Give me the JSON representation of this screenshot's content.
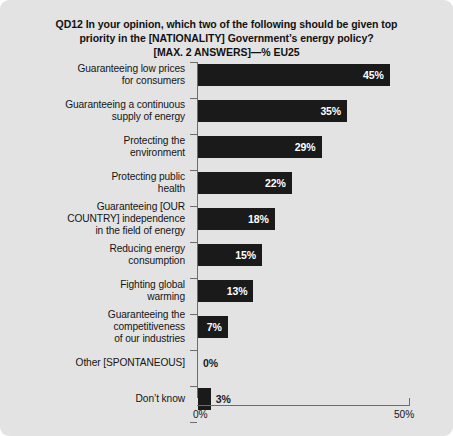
{
  "chart_data": {
    "type": "bar",
    "orientation": "horizontal",
    "title_lines": [
      "QD12 In your opinion, which two of the following should be given top",
      "priority in the [NATIONALITY] Government’s energy policy?",
      "[MAX. 2 ANSWERS]—% EU25"
    ],
    "xlabel": "",
    "ylabel": "",
    "xlim": [
      0,
      50
    ],
    "grid": false,
    "legend": null,
    "bar_color": "#1a1a1a",
    "background_color": "#e3e3e3",
    "axis_color": "#6d6d6d",
    "x_tick_labels": [
      "0%",
      "50%"
    ],
    "x_tick_values": [
      0,
      50
    ],
    "categories": [
      "Guaranteeing low prices for consumers",
      "Guaranteeing a continuous supply of energy",
      "Protecting the environment",
      "Protecting public health",
      "Guaranteeing [OUR COUNTRY] independence in the field of energy",
      "Reducing energy consumption",
      "Fighting global warming",
      "Guaranteeing the competitiveness of our industries",
      "Other [SPONTANEOUS]",
      "Don’t know"
    ],
    "category_lines": [
      [
        "Guaranteeing low prices",
        "for consumers"
      ],
      [
        "Guaranteeing a continuous",
        "supply of energy"
      ],
      [
        "Protecting the",
        "environment"
      ],
      [
        "Protecting public",
        "health"
      ],
      [
        "Guaranteeing [OUR",
        "COUNTRY] independence",
        "in the field of energy"
      ],
      [
        "Reducing energy",
        "consumption"
      ],
      [
        "Fighting global",
        "warming"
      ],
      [
        "Guaranteeing the",
        "competitiveness",
        "of our industries"
      ],
      [
        "Other [SPONTANEOUS]"
      ],
      [
        "Don’t know"
      ]
    ],
    "values": [
      45,
      35,
      29,
      22,
      18,
      15,
      13,
      7,
      0,
      3
    ],
    "value_labels": [
      "45%",
      "35%",
      "29%",
      "22%",
      "18%",
      "15%",
      "13%",
      "7%",
      "0%",
      "3%"
    ],
    "label_placement": [
      "inside",
      "inside",
      "inside",
      "inside",
      "inside",
      "inside",
      "inside",
      "inside",
      "outside",
      "outside"
    ]
  }
}
